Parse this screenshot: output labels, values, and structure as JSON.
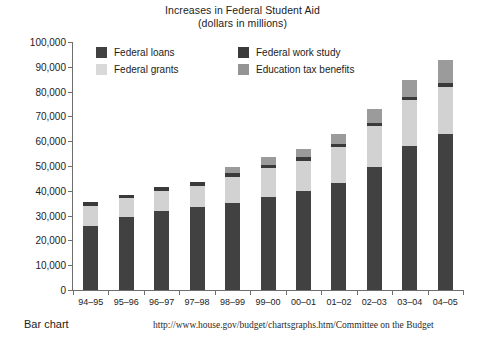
{
  "chart_data": {
    "type": "bar",
    "title": "Increases in Federal Student Aid",
    "subtitle": "(dollars in millions)",
    "xlabel": "",
    "ylabel": "",
    "ylim": [
      0,
      100000
    ],
    "ytick_step": 10000,
    "grid": false,
    "stacked": true,
    "legend_position": "top-inside",
    "categories": [
      "94–95",
      "95–96",
      "96–97",
      "97–98",
      "98–99",
      "99–00",
      "00–01",
      "01–02",
      "02–03",
      "03–04",
      "04–05"
    ],
    "ytick_labels": [
      "100,000",
      "90,000",
      "80,000",
      "70,000",
      "60,000",
      "50,000",
      "40,000",
      "30,000",
      "20,000",
      "10,000",
      "0"
    ],
    "ytick_values": [
      100000,
      90000,
      80000,
      70000,
      60000,
      50000,
      40000,
      30000,
      20000,
      10000,
      0
    ],
    "series": [
      {
        "name": "Federal loans",
        "color": "#414141",
        "values": [
          26000,
          29500,
          32000,
          33500,
          35000,
          37500,
          40000,
          43000,
          49500,
          58000,
          63000
        ]
      },
      {
        "name": "Federal grants",
        "color": "#d2d2d2",
        "values": [
          8000,
          7500,
          8000,
          8500,
          10500,
          11500,
          12000,
          14500,
          16500,
          18500,
          19000
        ]
      },
      {
        "name": "Federal work study",
        "color": "#3a3a3a",
        "values": [
          1400,
          1400,
          1400,
          1500,
          1500,
          1500,
          1500,
          1500,
          1500,
          1500,
          1600
        ]
      },
      {
        "name": "Education tax benefits",
        "color": "#9b9b9b",
        "values": [
          0,
          0,
          0,
          0,
          2500,
          3000,
          3500,
          4000,
          5500,
          6500,
          9200
        ]
      }
    ],
    "totals": [
      35400,
      38400,
      41400,
      43500,
      49500,
      53500,
      57000,
      63000,
      73000,
      84500,
      92800
    ]
  },
  "legend": {
    "items": [
      {
        "label": "Federal loans",
        "swatch": "loans"
      },
      {
        "label": "Federal work study",
        "swatch": "work"
      },
      {
        "label": "Federal grants",
        "swatch": "grants"
      },
      {
        "label": "Education tax benefits",
        "swatch": "tax"
      }
    ]
  },
  "footer": {
    "left": "Bar chart",
    "source": "http://www.house.gov/budget/chartsgraphs.htm/Committee on the Budget"
  }
}
